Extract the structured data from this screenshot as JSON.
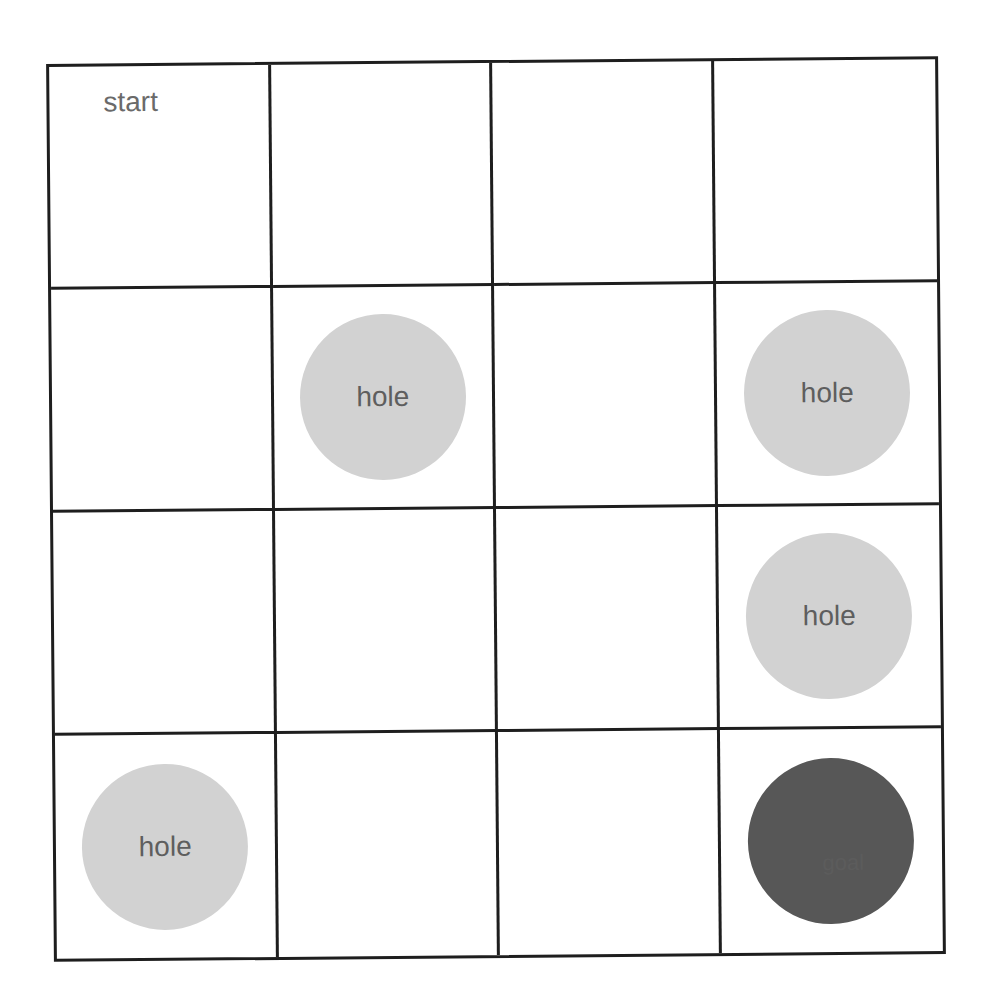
{
  "grid": {
    "rows": 4,
    "cols": 4,
    "colors": {
      "line": "#1e1e1e",
      "hole_fill": "#d2d2d2",
      "goal_fill": "#575757",
      "text": "#5e5e5e"
    },
    "cells": [
      [
        {
          "type": "start",
          "label": "start"
        },
        {
          "type": "empty"
        },
        {
          "type": "empty"
        },
        {
          "type": "empty"
        }
      ],
      [
        {
          "type": "empty"
        },
        {
          "type": "hole",
          "label": "hole"
        },
        {
          "type": "empty"
        },
        {
          "type": "hole",
          "label": "hole"
        }
      ],
      [
        {
          "type": "empty"
        },
        {
          "type": "empty"
        },
        {
          "type": "empty"
        },
        {
          "type": "hole",
          "label": "hole"
        }
      ],
      [
        {
          "type": "hole",
          "label": "hole"
        },
        {
          "type": "empty"
        },
        {
          "type": "empty"
        },
        {
          "type": "goal",
          "label": "goal"
        }
      ]
    ]
  }
}
